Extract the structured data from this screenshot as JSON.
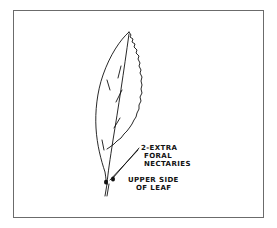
{
  "figure": {
    "annotations": [
      {
        "id": "nectaries",
        "lines": [
          "2-EXTRA",
          "FORAL",
          "NECTARIES"
        ]
      },
      {
        "id": "side",
        "lines": [
          "UPPER SIDE",
          "OF LEAF"
        ]
      }
    ]
  },
  "colors": {
    "ink": "#111111",
    "frame": "#6b6b6b",
    "background": "#ffffff"
  }
}
